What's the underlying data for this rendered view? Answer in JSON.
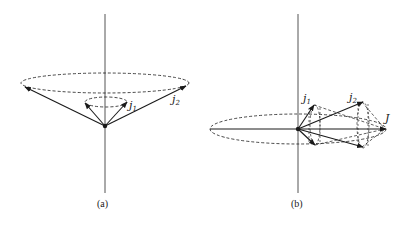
{
  "figure": {
    "panels": [
      {
        "id": "a",
        "caption": "(a)",
        "labels": {
          "j1": "j",
          "j1_sub": "1",
          "j2": "j",
          "j2_sub": "2"
        }
      },
      {
        "id": "b",
        "caption": "(b)",
        "labels": {
          "j1": "j",
          "j1_sub": "1",
          "j2": "j",
          "j2_sub": "2",
          "J": "J"
        }
      }
    ],
    "colors": {
      "line": "#1a1a1a",
      "axis": "#555555",
      "background": "#ffffff"
    }
  }
}
